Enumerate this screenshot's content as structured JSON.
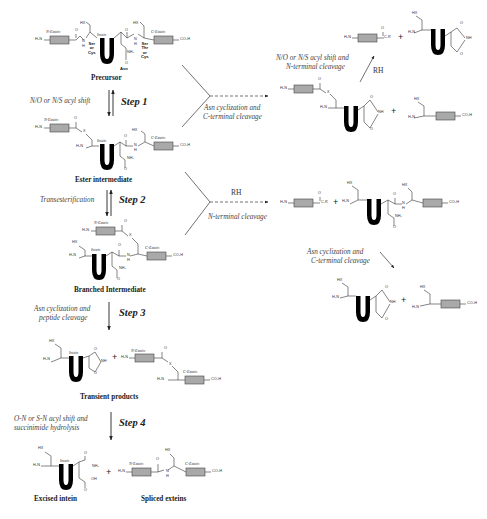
{
  "diagram": {
    "stages": {
      "precursor": "Precursor",
      "ester": "Ester intermediate",
      "branched": "Branched Intermediate",
      "transient": "Transient products",
      "excised": "Excised intein",
      "spliced": "Spliced exteins"
    },
    "steps": [
      {
        "label": "Step 1",
        "description": "N/O or N/S acyl shift"
      },
      {
        "label": "Step 2",
        "description": "Transesterification"
      },
      {
        "label": "Step 3",
        "description_line1": "Asn cyclization and",
        "description_line2": "peptide  cleavage"
      },
      {
        "label": "Step 4",
        "description_line1": "O-N or S-N acyl shift and",
        "description_line2": "succinimide hydrolysis"
      }
    ],
    "side_reactions": {
      "top_branch": {
        "line1": "Asn cyclization and",
        "line2": "C-terminal cleavage"
      },
      "top_up": {
        "line1": "N/O or N/S acyl shift and",
        "line2": "N-terminal cleavage",
        "reagent": "RH"
      },
      "middle_branch": {
        "reagent": "RH",
        "label": "N-terminal cleavage"
      },
      "middle_down": {
        "line1": "Asn cyclization and",
        "line2": "C-terminal cleavage"
      }
    },
    "chem_labels": {
      "n_extein": "N-Extein",
      "c_extein": "C-Extein",
      "intein": "Intein",
      "h2n": "H₂N",
      "co2h": "CO₂H",
      "hx": "HX",
      "o": "O",
      "nh": "NH",
      "h": "H",
      "n": "N",
      "x": "X",
      "nh2": "NH₂",
      "oh": "OH",
      "cr": "C-R",
      "plus": "+",
      "ser_or_cys": [
        "Ser",
        "or",
        "Cys"
      ],
      "ser_thr_cys": [
        "Ser",
        "Thr",
        "or",
        "Cys"
      ],
      "asn": "Asn"
    },
    "colors": {
      "extein_box": "#a9a9a9",
      "intein_u": "#000000",
      "line": "#333333",
      "italic_text": "#444444"
    }
  }
}
